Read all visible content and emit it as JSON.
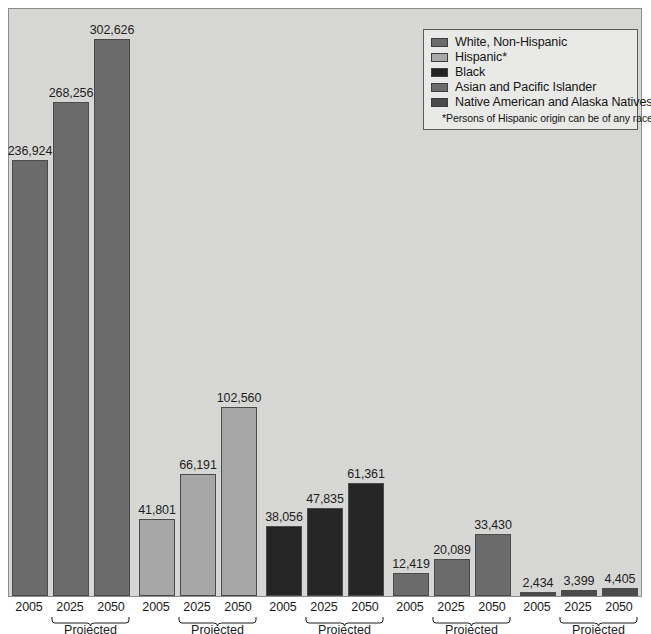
{
  "chart_data": {
    "type": "bar",
    "title": "",
    "subtitle": "",
    "xlabel": "",
    "ylabel": "",
    "ylim": [
      0,
      302626
    ],
    "grid": false,
    "units": "thousands of persons",
    "categories": [
      "2005",
      "2025",
      "2050"
    ],
    "projected_categories": [
      "2025",
      "2050"
    ],
    "projected_label": "Projected",
    "legend_position": "top-right",
    "series": [
      {
        "name": "White, Non-Hispanic",
        "color": "#6b6b6b",
        "values": [
          236924,
          268256,
          302626
        ],
        "labels": [
          "236,924",
          "268,256",
          "302,626"
        ]
      },
      {
        "name": "Hispanic*",
        "color": "#a8a8a8",
        "values": [
          41801,
          66191,
          102560
        ],
        "labels": [
          "41,801",
          "66,191",
          "102,560"
        ]
      },
      {
        "name": "Black",
        "color": "#232323",
        "values": [
          38056,
          47835,
          61361
        ],
        "labels": [
          "38,056",
          "47,835",
          "61,361"
        ]
      },
      {
        "name": "Asian and Pacific Islander",
        "color": "#6b6b6b",
        "values": [
          12419,
          20089,
          33430
        ],
        "labels": [
          "12,419",
          "20,089",
          "33,430"
        ]
      },
      {
        "name": "Native American and Alaska Natives",
        "color": "#4a4a4a",
        "values": [
          2434,
          3399,
          4405
        ],
        "labels": [
          "2,434",
          "3,399",
          "4,405"
        ]
      }
    ]
  },
  "legend": {
    "items": [
      {
        "label": "White, Non-Hispanic",
        "color": "#6b6b6b"
      },
      {
        "label": "Hispanic*",
        "color": "#a8a8a8"
      },
      {
        "label": "Black",
        "color": "#232323"
      },
      {
        "label": "Asian and Pacific Islander",
        "color": "#6b6b6b"
      },
      {
        "label": "Native American and Alaska Natives",
        "color": "#4a4a4a"
      }
    ],
    "note": "*Persons of Hispanic origin can be of any race."
  },
  "axis": {
    "ticks": [
      "2005",
      "2025",
      "2050",
      "2005",
      "2025",
      "2050",
      "2005",
      "2025",
      "2050",
      "2005",
      "2025",
      "2050",
      "2005",
      "2025",
      "2050"
    ],
    "projected_label": "Projected"
  },
  "values_flat": {
    "labels": [
      "236,924",
      "268,256",
      "302,626",
      "41,801",
      "66,191",
      "102,560",
      "38,056",
      "47,835",
      "61,361",
      "12,419",
      "20,089",
      "33,430",
      "2,434",
      "3,399",
      "4,405"
    ]
  }
}
